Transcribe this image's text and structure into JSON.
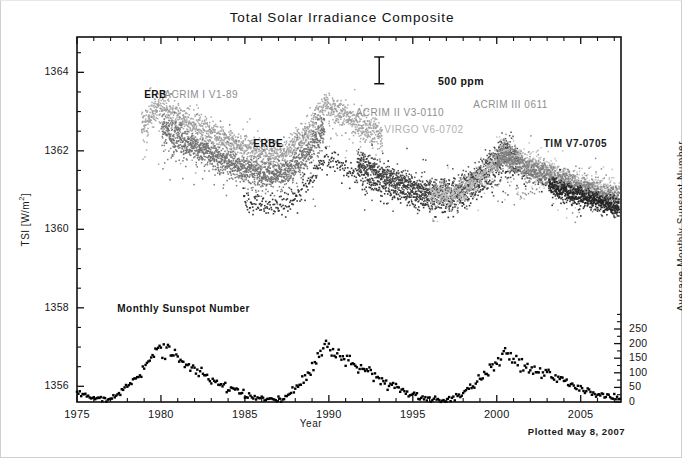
{
  "figure": {
    "title": "Total Solar Irradiance Composite",
    "footnote": "Plotted May  8, 2007"
  },
  "chart_data": {
    "type": "scatter",
    "title": "Total Solar Irradiance Composite",
    "xlabel": "Year",
    "ylabel": "TSI [W/m²]",
    "ylabel_right": "Average Monthly Sunspot Number",
    "xlim": [
      1975,
      2007.4
    ],
    "ylim": [
      1355.6,
      1364.9
    ],
    "ylim_right": [
      0,
      1250
    ],
    "xticks": [
      1975,
      1980,
      1985,
      1990,
      1995,
      2000,
      2005
    ],
    "xtick_labels": [
      "1975",
      "1980",
      "1985",
      "1990",
      "1995",
      "2000",
      "2005"
    ],
    "xminor_step": 1,
    "yticks": [
      1356,
      1358,
      1360,
      1362,
      1364
    ],
    "ytick_labels": [
      "1356",
      "1358",
      "1360",
      "1362",
      "1364"
    ],
    "yminor_step": 0.5,
    "yticks_right": [
      0,
      50,
      100,
      150,
      200,
      250
    ],
    "ytick_labels_right": [
      "0",
      "50",
      "100",
      "150",
      "200",
      "250"
    ],
    "grid": false,
    "legend_position": "in-plot-annotations",
    "errorbar": {
      "label": "500 ppm",
      "x": 1993.0,
      "y_center": 1364.05,
      "half_height_wm2": 0.341
    },
    "annotations": [
      {
        "text": "ERB",
        "x": 1979.0,
        "y": 1363.4,
        "color": "#111111",
        "style": "bold"
      },
      {
        "text": "ACRIM I V1-89",
        "x": 1980.2,
        "y": 1363.4,
        "color": "#8d8d8d",
        "style": "gray"
      },
      {
        "text": "ERBE",
        "x": 1985.5,
        "y": 1362.15,
        "color": "#111111",
        "style": "bold"
      },
      {
        "text": "ACRIM II V3-0110",
        "x": 1991.6,
        "y": 1362.95,
        "color": "#8d8d8d",
        "style": "gray"
      },
      {
        "text": "VIRGO V6-0702",
        "x": 1993.3,
        "y": 1362.5,
        "color": "#b0b0b0",
        "style": "gray"
      },
      {
        "text": "ACRIM III 0611",
        "x": 1998.6,
        "y": 1363.15,
        "color": "#8d8d8d",
        "style": "gray"
      },
      {
        "text": "TIM V7-0705",
        "x": 2002.8,
        "y": 1362.15,
        "color": "#1a1a1a",
        "style": "bold"
      },
      {
        "text": "Monthly Sunspot Number",
        "x": 1977.4,
        "y": 1357.95,
        "color": "#111111",
        "style": "bold"
      }
    ],
    "series": [
      {
        "name": "ERB",
        "axis": "left",
        "color": "#8a8a8a",
        "marker": "dot",
        "x_range": [
          1978.8,
          1993.2
        ],
        "description": "Nimbus-7 ERB daily TSI, declining from ~1363.8 at 1979 solar max to ~1360.3 near 1986 minimum, rising to ~1361.5 by 1991"
      },
      {
        "name": "ACRIM I V1-89",
        "axis": "left",
        "color": "#555555",
        "marker": "dot",
        "x_range": [
          1980.0,
          1989.8
        ],
        "description": "SMM/ACRIM I daily TSI, 1363.2 at 1980 max down to 1360.2 at 1986 min"
      },
      {
        "name": "ERBE",
        "axis": "left",
        "color": "#333333",
        "marker": "dot",
        "x_range": [
          1984.9,
          2003.0
        ],
        "description": "ERBS/ERBE TSI near 1360.5-1361.5 band"
      },
      {
        "name": "ACRIM II V3-0110",
        "axis": "left",
        "color": "#444444",
        "marker": "dot",
        "x_range": [
          1991.7,
          2001.2
        ],
        "description": "UARS/ACRIM II TSI, solar max ~1362.3 in 1991, min ~1360.6 in 1996, rising to ~1362.0 in 2000"
      },
      {
        "name": "VIRGO V6-0702",
        "axis": "left",
        "color": "#b5b5b5",
        "marker": "dot",
        "x_range": [
          1996.0,
          2007.3
        ],
        "description": "SoHO/VIRGO TSI 1360.5-1362.5"
      },
      {
        "name": "ACRIM III 0611",
        "axis": "left",
        "color": "#7a7a7a",
        "marker": "dot",
        "x_range": [
          2000.0,
          2007.3
        ],
        "description": "ACRIMSAT/ACRIM III TSI"
      },
      {
        "name": "TIM V7-0705",
        "axis": "left",
        "color": "#222222",
        "marker": "dot",
        "x_range": [
          2003.1,
          2007.3
        ],
        "description": "SORCE/TIM TSI near 1361"
      },
      {
        "name": "Monthly Sunspot Number",
        "axis": "right",
        "color": "#000000",
        "marker": "dot",
        "x_range": [
          1975.0,
          2007.3
        ],
        "cycle_peaks": [
          {
            "year": 1979.9,
            "value": 200
          },
          {
            "year": 1989.8,
            "value": 200
          },
          {
            "year": 2000.5,
            "value": 175
          }
        ],
        "cycle_minima": [
          {
            "year": 1976.4,
            "value": 12
          },
          {
            "year": 1986.6,
            "value": 8
          },
          {
            "year": 1996.6,
            "value": 8
          },
          {
            "year": 2007.2,
            "value": 10
          }
        ]
      }
    ]
  }
}
